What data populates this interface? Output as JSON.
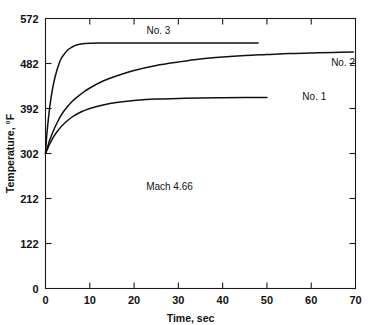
{
  "chart_data": {
    "type": "line",
    "title": "",
    "xlabel": "Time, sec",
    "ylabel": "Temperature, °F",
    "xlim": [
      0,
      70
    ],
    "ylim": [
      0,
      572
    ],
    "grid": false,
    "legend_position": "inline-end-of-curve",
    "xticks": [
      0,
      10,
      20,
      30,
      40,
      50,
      60,
      70
    ],
    "xtick_labels": [
      "0",
      "10",
      "20",
      "30",
      "40",
      "50",
      "60",
      "70"
    ],
    "yticks": [
      0,
      122,
      212,
      302,
      392,
      482,
      572
    ],
    "ytick_labels": [
      "0",
      "122",
      "212",
      "302",
      "392",
      "482",
      "572"
    ],
    "annotations": [
      {
        "text": "Mach 4.66",
        "x": 28,
        "y": 230
      }
    ],
    "series": [
      {
        "name": "No. 1",
        "label": "No. 1",
        "label_x": 58,
        "label_y": 410,
        "points": [
          [
            0,
            302
          ],
          [
            0.5,
            312
          ],
          [
            1,
            322
          ],
          [
            2,
            338
          ],
          [
            3,
            350
          ],
          [
            4,
            360
          ],
          [
            6,
            375
          ],
          [
            8,
            385
          ],
          [
            10,
            392
          ],
          [
            13,
            399
          ],
          [
            16,
            404
          ],
          [
            20,
            408
          ],
          [
            25,
            411
          ],
          [
            30,
            412
          ],
          [
            35,
            413
          ],
          [
            40,
            413.5
          ],
          [
            45,
            414
          ],
          [
            50,
            414
          ]
        ]
      },
      {
        "name": "No. 2",
        "label": "No. 2",
        "label_x": 64.5,
        "label_y": 478,
        "points": [
          [
            0,
            302
          ],
          [
            0.5,
            316
          ],
          [
            1,
            330
          ],
          [
            2,
            352
          ],
          [
            3,
            370
          ],
          [
            4,
            385
          ],
          [
            6,
            406
          ],
          [
            8,
            421
          ],
          [
            10,
            433
          ],
          [
            13,
            447
          ],
          [
            16,
            457
          ],
          [
            20,
            468
          ],
          [
            25,
            478
          ],
          [
            30,
            485
          ],
          [
            35,
            491
          ],
          [
            40,
            495
          ],
          [
            45,
            498
          ],
          [
            50,
            500
          ],
          [
            55,
            502
          ],
          [
            60,
            503
          ],
          [
            65,
            504
          ],
          [
            69.5,
            505
          ]
        ]
      },
      {
        "name": "No. 3",
        "label": "No. 3",
        "label_x": 25.5,
        "label_y": 542,
        "points": [
          [
            0,
            302
          ],
          [
            0.3,
            340
          ],
          [
            0.7,
            375
          ],
          [
            1,
            398
          ],
          [
            1.5,
            427
          ],
          [
            2,
            449
          ],
          [
            2.5,
            466
          ],
          [
            3,
            480
          ],
          [
            3.5,
            491
          ],
          [
            4,
            498
          ],
          [
            5,
            509
          ],
          [
            6,
            515
          ],
          [
            7,
            519
          ],
          [
            8,
            521
          ],
          [
            9,
            522
          ],
          [
            10,
            522.5
          ],
          [
            12,
            523
          ],
          [
            20,
            523
          ],
          [
            30,
            523
          ],
          [
            40,
            523
          ],
          [
            48,
            523
          ]
        ]
      }
    ]
  },
  "colors": {
    "curve": "#111111",
    "axis": "#1a1a1a",
    "background": "#ffffff"
  }
}
